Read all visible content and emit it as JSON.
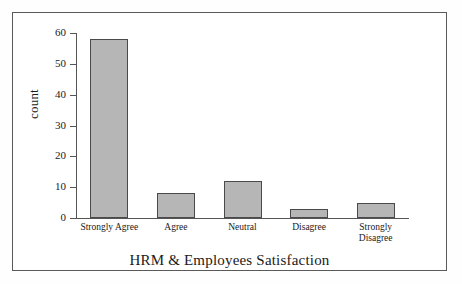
{
  "chart_data": {
    "type": "bar",
    "title": "",
    "xlabel": "HRM & Employees Satisfaction",
    "ylabel": "count",
    "categories": [
      "Strongly Agree",
      "Agree",
      "Neutral",
      "Disagree",
      "Strongly Disagree"
    ],
    "values": [
      58,
      8,
      12,
      3,
      5
    ],
    "ylim": [
      0,
      60
    ],
    "yticks": [
      0,
      10,
      20,
      30,
      40,
      50,
      60
    ],
    "ytick_labels": [
      "0",
      "10",
      "20",
      "30",
      "40",
      "50",
      "60"
    ],
    "grid": false,
    "legend": null,
    "bar_color": "#b6b6b6",
    "bar_edge_color": "#4a4a4a",
    "axis_color": "#555555",
    "frame_color": "#5a5a5a",
    "background_color": "#ffffff"
  },
  "category_lines": [
    [
      "Strongly Agree"
    ],
    [
      "Agree"
    ],
    [
      "Neutral"
    ],
    [
      "Disagree"
    ],
    [
      "Strongly",
      "Disagree"
    ]
  ]
}
